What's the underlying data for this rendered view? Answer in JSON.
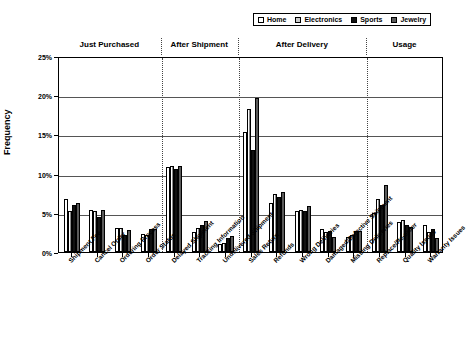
{
  "chart": {
    "type": "bar",
    "ylabel": "Frequency"
  },
  "legend": {
    "position": "top-right",
    "items": [
      {
        "label": "Home",
        "swatch": "white",
        "color": "#ffffff"
      },
      {
        "label": "Electronics",
        "swatch": "light-gray-hatched",
        "color": "#cccccc"
      },
      {
        "label": "Sports",
        "swatch": "black",
        "color": "#111111"
      },
      {
        "label": "Jewelry",
        "swatch": "dark-gray",
        "color": "#5a5a5a"
      }
    ]
  },
  "yaxis": {
    "ticks": [
      "0%",
      "5%",
      "10%",
      "15%",
      "20%",
      "25%"
    ],
    "min": 0,
    "max": 25
  },
  "sections": [
    {
      "label": "Just Purchased",
      "start": 0,
      "end": 3
    },
    {
      "label": "After Shipment",
      "start": 4,
      "end": 6
    },
    {
      "label": "After Delivery",
      "start": 7,
      "end": 11
    },
    {
      "label": "Usage",
      "start": 12,
      "end": 14
    }
  ],
  "chart_data": {
    "type": "bar",
    "title": "",
    "xlabel": "",
    "ylabel": "Frequency",
    "ylim": [
      0,
      25
    ],
    "yticks": [
      0,
      5,
      10,
      15,
      20,
      25
    ],
    "ytick_labels": [
      "0%",
      "5%",
      "10%",
      "15%",
      "20%",
      "25%"
    ],
    "grid": true,
    "legend_position": "top-right",
    "categories": [
      "Shipment Fee",
      "Cancel Order",
      "Ordering Process",
      "Order Status",
      "Delayed Shipment",
      "Tracking Information",
      "Undelivered Shipment",
      "Sales Return",
      "Refunds",
      "Wrong Deliveries",
      "Damaged/Defective Shipment",
      "Missing Deliveries",
      "Replace/Re-order",
      "Quality Issues",
      "Warranty Issues"
    ],
    "group_labels": [
      "Just Purchased",
      "After Shipment",
      "After Delivery",
      "Usage"
    ],
    "series": [
      {
        "name": "Home",
        "values": [
          6.7,
          5.3,
          3.1,
          2.3,
          10.9,
          2.5,
          1.0,
          15.3,
          6.3,
          5.2,
          2.9,
          1.9,
          5.0,
          3.8,
          3.4
        ]
      },
      {
        "name": "Electronics",
        "values": [
          5.2,
          5.2,
          3.0,
          2.2,
          11.0,
          3.0,
          1.1,
          18.3,
          7.4,
          5.3,
          2.6,
          2.2,
          6.7,
          4.1,
          2.6
        ]
      },
      {
        "name": "Sports",
        "values": [
          6.0,
          4.5,
          2.2,
          2.9,
          10.6,
          3.4,
          1.8,
          13.0,
          7.0,
          5.2,
          2.7,
          2.7,
          6.0,
          3.5,
          2.9
        ]
      },
      {
        "name": "Jewelry",
        "values": [
          6.2,
          5.3,
          2.8,
          2.9,
          11.0,
          4.0,
          2.0,
          19.7,
          7.6,
          5.9,
          1.9,
          2.7,
          8.5,
          3.2,
          1.8
        ]
      }
    ]
  }
}
